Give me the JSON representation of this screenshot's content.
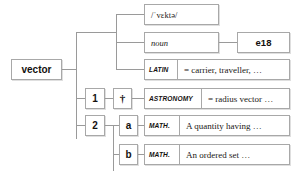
{
  "diagram": {
    "title": "vector",
    "kind": "dictionary-entry-tree",
    "colors": {
      "page_background": "#ffffff",
      "box_border": "#a8a8a8",
      "connector": "#9a9a9a",
      "text": "#14110f"
    }
  },
  "headword": {
    "label": "vector"
  },
  "entry_block": {
    "pronunciation": {
      "label": "/ˈvɛktə/"
    },
    "part_of_speech": {
      "label": "noun"
    },
    "first_use_date": {
      "label": "e18"
    },
    "etymology": {
      "language_label": "LATIN",
      "gloss": "= carrier, traveller, …"
    }
  },
  "senses": [
    {
      "number": "1",
      "marker": "†",
      "marker_name": "obsolete-dagger",
      "domain_label": "ASTRONOMY",
      "gloss": "= radius vector …"
    },
    {
      "number": "2",
      "subsenses": [
        {
          "letter": "a",
          "domain_label": "MATH.",
          "gloss": "A quantity having …"
        },
        {
          "letter": "b",
          "domain_label": "MATH.",
          "gloss": "An ordered set …"
        }
      ]
    }
  ]
}
